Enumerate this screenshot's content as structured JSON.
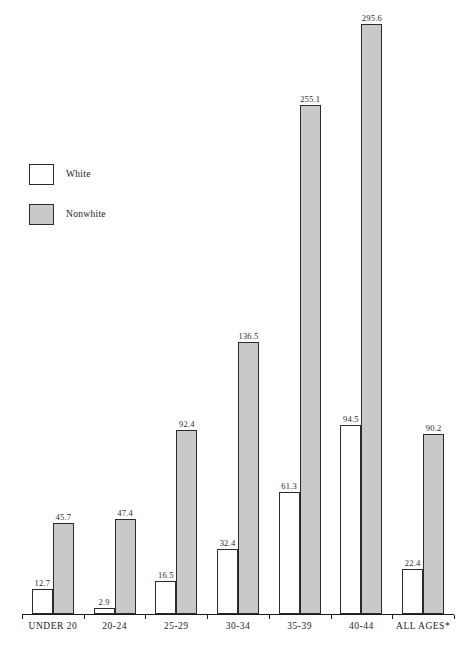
{
  "chart_data": {
    "type": "bar",
    "title": "",
    "subtitle": "",
    "xlabel": "",
    "ylabel": "",
    "grid": false,
    "legend_position": "upper-left",
    "ylim": [
      0,
      295.6
    ],
    "categories": [
      "UNDER 20",
      "20-24",
      "25-29",
      "30-34",
      "35-39",
      "40-44",
      "ALL AGES*"
    ],
    "series": [
      {
        "name": "White",
        "color": "#ffffff",
        "border_color": "#2b2b2b",
        "values": [
          12.7,
          2.9,
          16.5,
          32.4,
          61.3,
          94.5,
          22.4
        ]
      },
      {
        "name": "Nonwhite",
        "color": "#c9c9c9",
        "border_color": "#2b2b2b",
        "values": [
          45.7,
          47.4,
          92.4,
          136.5,
          255.1,
          295.6,
          90.2
        ]
      }
    ],
    "value_labels": [
      "12.7",
      "45.7",
      "2.9",
      "47.4",
      "16.5",
      "92.4",
      "32.4",
      "136.5",
      "61.3",
      "255.1",
      "94.5",
      "295.6",
      "22.4",
      "90.2"
    ]
  },
  "legend": {
    "items": [
      {
        "label": "White",
        "swatch": "white"
      },
      {
        "label": "Nonwhite",
        "swatch": "nonwhite"
      }
    ]
  },
  "axis": {
    "tick_labels": [
      "UNDER 20",
      "20-24",
      "25-29",
      "30-34",
      "35-39",
      "40-44",
      "ALL AGES*"
    ]
  }
}
